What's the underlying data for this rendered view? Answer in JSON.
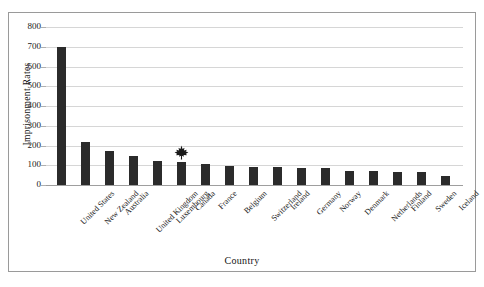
{
  "figure": {
    "top_fragment_text": "",
    "frame_color": "#9a9a9a",
    "background": "#ffffff"
  },
  "chart_data": {
    "type": "bar",
    "title": "",
    "xlabel": "Country",
    "ylabel": "Imprisonment Rates",
    "categories": [
      "United States",
      "New Zealand",
      "Australia",
      "United Kingdom",
      "Luxembourg",
      "Canada",
      "France",
      "Belgium",
      "Switzerland",
      "Ireland",
      "Germany",
      "Norway",
      "Denmark",
      "Netherlands",
      "Finland",
      "Sweden",
      "Iceland"
    ],
    "values": [
      700,
      220,
      170,
      145,
      120,
      115,
      105,
      95,
      92,
      90,
      88,
      85,
      72,
      70,
      68,
      65,
      45
    ],
    "ylim": [
      0,
      800
    ],
    "yticks": [
      0,
      100,
      200,
      300,
      400,
      500,
      600,
      700,
      800
    ],
    "ytick_labels": [
      "0",
      "100",
      "200",
      "300",
      "400",
      "500",
      "600",
      "700",
      "800"
    ],
    "grid": true,
    "legend": "none",
    "bar_color": "#2b2b2b",
    "gridline_color": "#d6d6d6",
    "annotations": [
      {
        "name": "maple-leaf-marker",
        "category": "Canada",
        "value": 115,
        "color": "#1a1a1a"
      }
    ]
  }
}
